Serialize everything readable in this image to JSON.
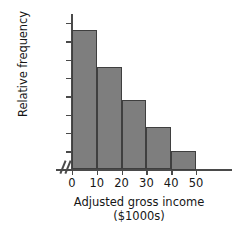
{
  "chart_data": {
    "type": "bar",
    "title": "",
    "xlabel": "Adjusted gross income",
    "xlabel_units": "($1000s)",
    "ylabel": "Relative frequency",
    "categories": [
      "0-10",
      "10-20",
      "20-30",
      "30-40",
      "40-50"
    ],
    "bin_edges": [
      0,
      10,
      20,
      30,
      40,
      50
    ],
    "values": [
      0.38,
      0.28,
      0.19,
      0.115,
      0.05
    ],
    "xlim": [
      0,
      50
    ],
    "ylim": [
      0.0,
      0.4
    ],
    "x_ticks": [
      "0",
      "10",
      "20",
      "30",
      "40",
      "50"
    ],
    "x_tick_values": [
      0,
      10,
      20,
      30,
      40,
      50
    ],
    "y_ticks": [
      "0.00",
      "0.05",
      "0.10",
      "0.15",
      "0.20",
      "0.25",
      "0.30",
      "0.35",
      "0.40"
    ],
    "y_tick_values": [
      0.0,
      0.05,
      0.1,
      0.15,
      0.2,
      0.25,
      0.3,
      0.35,
      0.4
    ],
    "grid": false,
    "legend": false,
    "axis_break": "//",
    "bar_color": "#7e7e7e",
    "bar_edge_color": "#3f3f3f",
    "axis_color": "#4a4a4a"
  }
}
